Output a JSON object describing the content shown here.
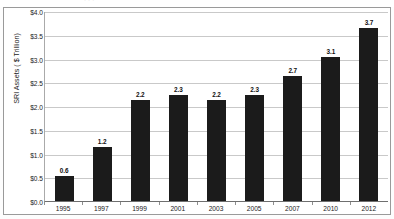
{
  "figure": {
    "top_strip_ghost_text": "· · ·",
    "background_color": "#ffffff",
    "border_color": "#9a9a9a"
  },
  "chart_data": {
    "type": "bar",
    "title": "",
    "xlabel": "",
    "ylabel": "SRI Assets ( $ Trillion)",
    "categories": [
      "1995",
      "1997",
      "1999",
      "2001",
      "2003",
      "2005",
      "2007",
      "2010",
      "2012"
    ],
    "values": [
      0.6,
      1.2,
      2.2,
      2.3,
      2.2,
      2.3,
      2.7,
      3.1,
      3.7
    ],
    "data_labels": [
      "0.6",
      "1.2",
      "2.2",
      "2.3",
      "2.2",
      "2.3",
      "2.7",
      "3.1",
      "3.7"
    ],
    "ylim": [
      0,
      4
    ],
    "ytick_values": [
      0,
      0.5,
      1,
      1.5,
      2,
      2.5,
      3,
      3.5,
      4
    ],
    "ytick_labels": [
      "$0.0",
      "$0.5",
      "$1.0",
      "$1.5",
      "$2.0",
      "$2.5",
      "$3.0",
      "$3.5",
      "$4.0"
    ],
    "grid": true,
    "legend": false,
    "bar_color": "#1b1b1b",
    "gridline_color": "#c9c9c9"
  }
}
